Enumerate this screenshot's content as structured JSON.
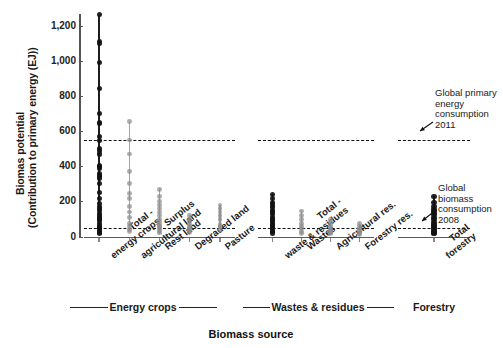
{
  "chart_data": {
    "type": "scatter",
    "title": "",
    "xlabel": "Biomass source",
    "ylabel_line1": "Biomas potential",
    "ylabel_line2": "(Contribution to primary energy (EJ))",
    "ylim": [
      0,
      1300
    ],
    "yticks": [
      0,
      200,
      400,
      600,
      800,
      1000,
      1200
    ],
    "ytick_labels": [
      "0",
      "200",
      "400",
      "600",
      "800",
      "1,000",
      "1,200"
    ],
    "grid": false,
    "legend": "none",
    "groups": [
      {
        "name": "Energy crops",
        "categories": [
          {
            "label_lines": [
              "Total -",
              "energy crops"
            ],
            "color": "#111111",
            "range": [
              20,
              1265
            ],
            "values": [
              1265,
              1110,
              1100,
              990,
              845,
              700,
              650,
              645,
              570,
              545,
              500,
              490,
              470,
              405,
              400,
              390,
              360,
              350,
              340,
              330,
              300,
              250,
              215,
              190,
              170,
              160,
              150,
              130,
              120,
              110,
              100,
              90,
              75,
              60,
              50,
              45,
              35,
              25,
              20
            ]
          },
          {
            "label_lines": [
              "Surplus",
              "agricultural land"
            ],
            "color": "#8c8c8c",
            "range": [
              30,
              655
            ],
            "values": [
              655,
              550,
              470,
              370,
              300,
              245,
              215,
              170,
              140,
              110,
              75,
              55,
              40,
              30
            ]
          },
          {
            "label_lines": [
              "Rest land"
            ],
            "color": "#8c8c8c",
            "range": [
              20,
              270
            ],
            "values": [
              270,
              230,
              200,
              180,
              160,
              140,
              120,
              100,
              85,
              70,
              60,
              50,
              40,
              30,
              20
            ]
          },
          {
            "label_lines": [
              "Degraded land"
            ],
            "color": "#8c8c8c",
            "range": [
              25,
              120
            ],
            "values": [
              120,
              100,
              85,
              70,
              55,
              45,
              35,
              25
            ]
          },
          {
            "label_lines": [
              "Pasture"
            ],
            "color": "#8c8c8c",
            "range": [
              40,
              180
            ],
            "values": [
              180,
              160,
              140,
              120,
              95,
              70,
              55,
              40
            ]
          }
        ]
      },
      {
        "name": "Wastes & residues",
        "categories": [
          {
            "label_lines": [
              "Total -",
              "waste & residues"
            ],
            "color": "#111111",
            "range": [
              20,
              240
            ],
            "values": [
              240,
              215,
              195,
              180,
              165,
              150,
              140,
              125,
              110,
              100,
              90,
              80,
              70,
              60,
              50,
              40,
              30,
              20
            ]
          },
          {
            "label_lines": [
              "Wastes"
            ],
            "color": "#8c8c8c",
            "range": [
              15,
              145
            ],
            "values": [
              145,
              120,
              95,
              75,
              60,
              45,
              30,
              15
            ]
          },
          {
            "label_lines": [
              "Agricultural res."
            ],
            "color": "#8c8c8c",
            "range": [
              15,
              95
            ],
            "values": [
              95,
              80,
              65,
              50,
              40,
              30,
              20,
              15
            ]
          },
          {
            "label_lines": [
              "Forestry res."
            ],
            "color": "#8c8c8c",
            "range": [
              10,
              75
            ],
            "values": [
              75,
              60,
              48,
              38,
              28,
              18,
              10
            ]
          }
        ]
      },
      {
        "name": "Forestry",
        "categories": [
          {
            "label_lines": [
              "Total",
              "forestry"
            ],
            "color": "#111111",
            "range": [
              20,
              230
            ],
            "values": [
              230,
              195,
              170,
              155,
              140,
              125,
              110,
              95,
              80,
              65,
              55,
              45,
              35,
              25,
              20
            ]
          }
        ]
      }
    ],
    "reference_lines": [
      {
        "value": 550,
        "annotation_lines": [
          "Global primary",
          "energy",
          "consumption",
          "2011"
        ],
        "style": "dashed"
      },
      {
        "value": 50,
        "annotation_lines": [
          "Global",
          "biomass",
          "consumption",
          "2008"
        ],
        "style": "dashed"
      }
    ]
  },
  "colors": {
    "dark_series": "#111111",
    "light_series": "#8c8c8c",
    "axis": "#555555",
    "reference_line": "#111111",
    "background": "#ffffff"
  }
}
